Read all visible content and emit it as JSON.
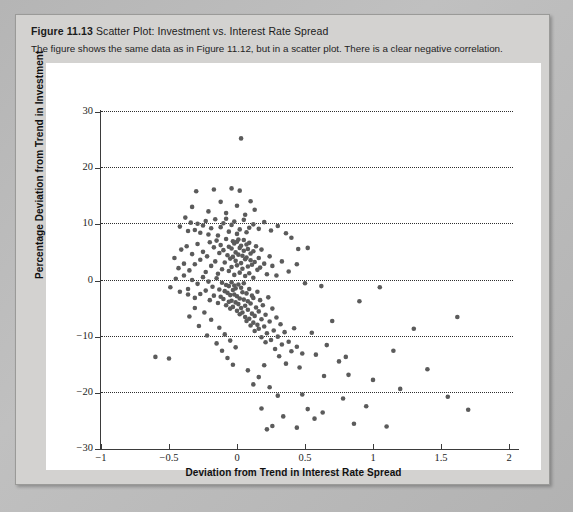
{
  "figure": {
    "number": "Figure 11.13",
    "title": "Scatter Plot: Investment vs. Interest Rate Spread",
    "caption": "The figure shows the same data as in Figure 11.12, but in a scatter plot. There is a clear negative correlation.",
    "background_color": "#d3d2d0",
    "page_color": "#b9b9b9",
    "panel_color": "#ffffff"
  },
  "chart_data": {
    "type": "scatter",
    "title": "Scatter Plot: Investment vs. Interest Rate Spread",
    "xlabel": "Deviation from Trend in Interest Rate Spread",
    "ylabel": "Percentage Deviation from Trend in Investment",
    "xlim": [
      -1,
      2
    ],
    "ylim": [
      -30,
      30
    ],
    "xticks": [
      -1,
      -0.5,
      0,
      0.5,
      1,
      1.5,
      2
    ],
    "xtick_labels": [
      "−1",
      "−0.5",
      "0",
      "0.5",
      "1",
      "1.5",
      "2"
    ],
    "yticks": [
      -30,
      -20,
      -10,
      0,
      10,
      20,
      30
    ],
    "ytick_labels": [
      "−30",
      "−20",
      "−10",
      "0",
      "10",
      "20",
      "30"
    ],
    "grid": "horizontal-dotted",
    "legend": null,
    "marker": {
      "shape": "circle",
      "color": "#5b5b5b",
      "size_px": 4.6
    },
    "annotation": "Clear negative correlation between interest rate spread deviation and investment deviation.",
    "points": [
      [
        0.03,
        25.3
      ],
      [
        -0.33,
        13.1
      ],
      [
        -0.3,
        15.9
      ],
      [
        -0.21,
        12.3
      ],
      [
        -0.17,
        16.2
      ],
      [
        -0.12,
        14.0
      ],
      [
        -0.08,
        12.0
      ],
      [
        -0.04,
        16.4
      ],
      [
        0.0,
        13.3
      ],
      [
        0.02,
        16.0
      ],
      [
        0.06,
        11.7
      ],
      [
        0.1,
        14.1
      ],
      [
        0.13,
        12.6
      ],
      [
        -0.42,
        9.6
      ],
      [
        -0.38,
        11.2
      ],
      [
        -0.36,
        8.8
      ],
      [
        -0.34,
        10.3
      ],
      [
        -0.31,
        9.0
      ],
      [
        -0.29,
        10.1
      ],
      [
        -0.27,
        8.5
      ],
      [
        -0.25,
        9.8
      ],
      [
        -0.23,
        10.6
      ],
      [
        -0.21,
        8.2
      ],
      [
        -0.19,
        9.3
      ],
      [
        -0.16,
        10.9
      ],
      [
        -0.14,
        8.0
      ],
      [
        -0.12,
        9.5
      ],
      [
        -0.1,
        10.2
      ],
      [
        -0.08,
        11.0
      ],
      [
        -0.06,
        8.7
      ],
      [
        -0.04,
        9.9
      ],
      [
        -0.02,
        10.5
      ],
      [
        0.0,
        8.3
      ],
      [
        0.02,
        9.1
      ],
      [
        0.05,
        10.8
      ],
      [
        0.07,
        8.6
      ],
      [
        0.09,
        9.4
      ],
      [
        0.12,
        10.0
      ],
      [
        0.16,
        9.2
      ],
      [
        0.2,
        10.4
      ],
      [
        0.25,
        8.9
      ],
      [
        0.3,
        9.7
      ],
      [
        0.36,
        8.4
      ],
      [
        0.4,
        7.6
      ],
      [
        0.45,
        5.6
      ],
      [
        -0.46,
        4.0
      ],
      [
        -0.43,
        2.2
      ],
      [
        -0.41,
        5.5
      ],
      [
        -0.39,
        3.0
      ],
      [
        -0.37,
        6.1
      ],
      [
        -0.35,
        1.8
      ],
      [
        -0.33,
        4.7
      ],
      [
        -0.31,
        2.9
      ],
      [
        -0.29,
        6.5
      ],
      [
        -0.27,
        3.7
      ],
      [
        -0.25,
        5.1
      ],
      [
        -0.23,
        1.5
      ],
      [
        -0.22,
        4.3
      ],
      [
        -0.2,
        6.8
      ],
      [
        -0.19,
        2.6
      ],
      [
        -0.17,
        5.9
      ],
      [
        -0.16,
        3.4
      ],
      [
        -0.15,
        7.1
      ],
      [
        -0.14,
        1.2
      ],
      [
        -0.13,
        4.9
      ],
      [
        -0.12,
        6.3
      ],
      [
        -0.11,
        2.0
      ],
      [
        -0.1,
        5.4
      ],
      [
        -0.09,
        3.2
      ],
      [
        -0.08,
        7.4
      ],
      [
        -0.07,
        4.5
      ],
      [
        -0.06,
        1.7
      ],
      [
        -0.06,
        6.0
      ],
      [
        -0.05,
        3.9
      ],
      [
        -0.04,
        5.7
      ],
      [
        -0.04,
        2.4
      ],
      [
        -0.03,
        7.0
      ],
      [
        -0.03,
        4.2
      ],
      [
        -0.02,
        6.6
      ],
      [
        -0.02,
        1.0
      ],
      [
        -0.01,
        5.0
      ],
      [
        -0.01,
        3.5
      ],
      [
        0.0,
        6.9
      ],
      [
        0.0,
        2.7
      ],
      [
        0.01,
        4.6
      ],
      [
        0.01,
        7.3
      ],
      [
        0.02,
        1.4
      ],
      [
        0.02,
        5.8
      ],
      [
        0.03,
        3.1
      ],
      [
        0.03,
        6.2
      ],
      [
        0.04,
        4.4
      ],
      [
        0.04,
        2.1
      ],
      [
        0.05,
        5.3
      ],
      [
        0.05,
        7.2
      ],
      [
        0.06,
        3.8
      ],
      [
        0.06,
        0.8
      ],
      [
        0.07,
        6.4
      ],
      [
        0.07,
        4.1
      ],
      [
        0.08,
        2.5
      ],
      [
        0.08,
        5.6
      ],
      [
        0.09,
        1.3
      ],
      [
        0.09,
        6.7
      ],
      [
        0.1,
        3.6
      ],
      [
        0.1,
        4.8
      ],
      [
        0.11,
        2.8
      ],
      [
        0.12,
        5.2
      ],
      [
        0.12,
        0.5
      ],
      [
        0.13,
        3.3
      ],
      [
        0.14,
        6.1
      ],
      [
        0.15,
        1.9
      ],
      [
        0.16,
        4.0
      ],
      [
        0.17,
        2.3
      ],
      [
        0.18,
        5.5
      ],
      [
        0.2,
        3.0
      ],
      [
        0.22,
        1.1
      ],
      [
        0.24,
        4.3
      ],
      [
        0.26,
        2.6
      ],
      [
        0.29,
        0.9
      ],
      [
        0.33,
        3.4
      ],
      [
        0.38,
        1.6
      ],
      [
        0.44,
        2.9
      ],
      [
        -0.49,
        -1.2
      ],
      [
        -0.45,
        0.3
      ],
      [
        -0.42,
        -2.0
      ],
      [
        -0.39,
        0.9
      ],
      [
        -0.36,
        -1.5
      ],
      [
        -0.33,
        0.1
      ],
      [
        -0.31,
        -3.1
      ],
      [
        -0.29,
        -0.6
      ],
      [
        -0.27,
        -2.4
      ],
      [
        -0.25,
        0.6
      ],
      [
        -0.23,
        -1.8
      ],
      [
        -0.21,
        -0.2
      ],
      [
        -0.2,
        -3.5
      ],
      [
        -0.18,
        -1.1
      ],
      [
        -0.17,
        -2.7
      ],
      [
        -0.15,
        0.4
      ],
      [
        -0.14,
        -4.0
      ],
      [
        -0.13,
        -1.6
      ],
      [
        -0.12,
        -2.9
      ],
      [
        -0.11,
        -0.4
      ],
      [
        -0.1,
        -3.3
      ],
      [
        -0.09,
        -1.9
      ],
      [
        -0.08,
        -0.8
      ],
      [
        -0.08,
        -4.4
      ],
      [
        -0.07,
        -2.2
      ],
      [
        -0.06,
        -3.8
      ],
      [
        -0.06,
        -1.0
      ],
      [
        -0.05,
        -2.6
      ],
      [
        -0.05,
        -5.0
      ],
      [
        -0.04,
        -0.3
      ],
      [
        -0.04,
        -3.6
      ],
      [
        -0.03,
        -1.7
      ],
      [
        -0.03,
        -4.7
      ],
      [
        -0.02,
        -2.5
      ],
      [
        -0.02,
        -0.9
      ],
      [
        -0.01,
        -3.9
      ],
      [
        -0.01,
        -1.4
      ],
      [
        0.0,
        -5.4
      ],
      [
        0.0,
        -2.8
      ],
      [
        0.01,
        -4.2
      ],
      [
        0.01,
        -0.7
      ],
      [
        0.02,
        -3.2
      ],
      [
        0.02,
        -6.0
      ],
      [
        0.03,
        -1.3
      ],
      [
        0.03,
        -4.9
      ],
      [
        0.04,
        -2.1
      ],
      [
        0.04,
        -5.7
      ],
      [
        0.05,
        -3.4
      ],
      [
        0.05,
        -0.5
      ],
      [
        0.06,
        -6.5
      ],
      [
        0.06,
        -4.5
      ],
      [
        0.07,
        -2.3
      ],
      [
        0.07,
        -7.2
      ],
      [
        0.08,
        -5.2
      ],
      [
        0.08,
        -3.7
      ],
      [
        0.09,
        -1.5
      ],
      [
        0.09,
        -6.8
      ],
      [
        0.1,
        -4.1
      ],
      [
        0.1,
        -8.0
      ],
      [
        0.11,
        -2.7
      ],
      [
        0.11,
        -5.9
      ],
      [
        0.12,
        -7.5
      ],
      [
        0.12,
        -3.1
      ],
      [
        0.13,
        -6.3
      ],
      [
        0.13,
        -9.0
      ],
      [
        0.14,
        -4.8
      ],
      [
        0.15,
        -7.9
      ],
      [
        0.15,
        -2.0
      ],
      [
        0.16,
        -5.5
      ],
      [
        0.16,
        -8.6
      ],
      [
        0.17,
        -3.5
      ],
      [
        0.18,
        -6.9
      ],
      [
        0.18,
        -10.1
      ],
      [
        0.19,
        -4.4
      ],
      [
        0.2,
        -8.2
      ],
      [
        0.21,
        -11.0
      ],
      [
        0.21,
        -6.1
      ],
      [
        0.22,
        -9.4
      ],
      [
        0.23,
        -3.0
      ],
      [
        0.24,
        -7.3
      ],
      [
        0.25,
        -10.6
      ],
      [
        0.26,
        -5.0
      ],
      [
        0.27,
        -8.9
      ],
      [
        0.28,
        -12.2
      ],
      [
        0.29,
        -6.6
      ],
      [
        0.3,
        -10.0
      ],
      [
        0.31,
        -13.5
      ],
      [
        0.32,
        -7.8
      ],
      [
        0.33,
        -11.4
      ],
      [
        0.35,
        -9.2
      ],
      [
        0.36,
        -14.8
      ],
      [
        0.38,
        -10.9
      ],
      [
        0.4,
        -12.6
      ],
      [
        0.42,
        -8.5
      ],
      [
        0.44,
        -11.8
      ],
      [
        0.46,
        -15.5
      ],
      [
        0.48,
        -13.0
      ],
      [
        -0.6,
        -13.6
      ],
      [
        -0.5,
        -13.9
      ],
      [
        -0.36,
        -2.5
      ],
      [
        -0.35,
        -6.4
      ],
      [
        -0.31,
        -4.9
      ],
      [
        -0.28,
        -8.1
      ],
      [
        -0.24,
        -5.7
      ],
      [
        -0.22,
        -9.8
      ],
      [
        -0.19,
        -7.0
      ],
      [
        -0.15,
        -11.2
      ],
      [
        -0.13,
        -8.4
      ],
      [
        -0.11,
        -12.5
      ],
      [
        -0.09,
        -9.6
      ],
      [
        -0.07,
        -13.8
      ],
      [
        -0.05,
        -10.7
      ],
      [
        -0.03,
        -15.0
      ],
      [
        -0.01,
        -11.9
      ],
      [
        0.5,
        -0.5
      ],
      [
        0.52,
        5.8
      ],
      [
        0.55,
        -9.3
      ],
      [
        0.58,
        -13.2
      ],
      [
        0.62,
        -1.0
      ],
      [
        0.64,
        -17.0
      ],
      [
        0.66,
        -11.5
      ],
      [
        0.7,
        -7.2
      ],
      [
        0.75,
        -14.4
      ],
      [
        0.78,
        -21.0
      ],
      [
        0.8,
        -13.6
      ],
      [
        0.82,
        -16.8
      ],
      [
        0.86,
        -25.5
      ],
      [
        0.9,
        -3.7
      ],
      [
        0.95,
        -22.4
      ],
      [
        1.0,
        -17.7
      ],
      [
        1.05,
        -1.2
      ],
      [
        1.1,
        -26.0
      ],
      [
        1.15,
        -12.5
      ],
      [
        1.2,
        -19.3
      ],
      [
        1.3,
        -8.6
      ],
      [
        1.4,
        -15.8
      ],
      [
        1.55,
        -20.7
      ],
      [
        1.62,
        -6.5
      ],
      [
        1.7,
        -23.0
      ],
      [
        0.18,
        -22.8
      ],
      [
        0.22,
        -26.5
      ],
      [
        0.26,
        -25.9
      ],
      [
        0.3,
        -20.5
      ],
      [
        0.34,
        -24.2
      ],
      [
        0.44,
        -26.2
      ],
      [
        0.48,
        -20.3
      ],
      [
        0.52,
        -22.9
      ],
      [
        0.57,
        -24.6
      ],
      [
        0.63,
        -23.5
      ],
      [
        0.08,
        -16.0
      ],
      [
        0.12,
        -18.5
      ],
      [
        0.16,
        -17.2
      ],
      [
        0.2,
        -15.1
      ],
      [
        0.24,
        -19.0
      ]
    ]
  }
}
